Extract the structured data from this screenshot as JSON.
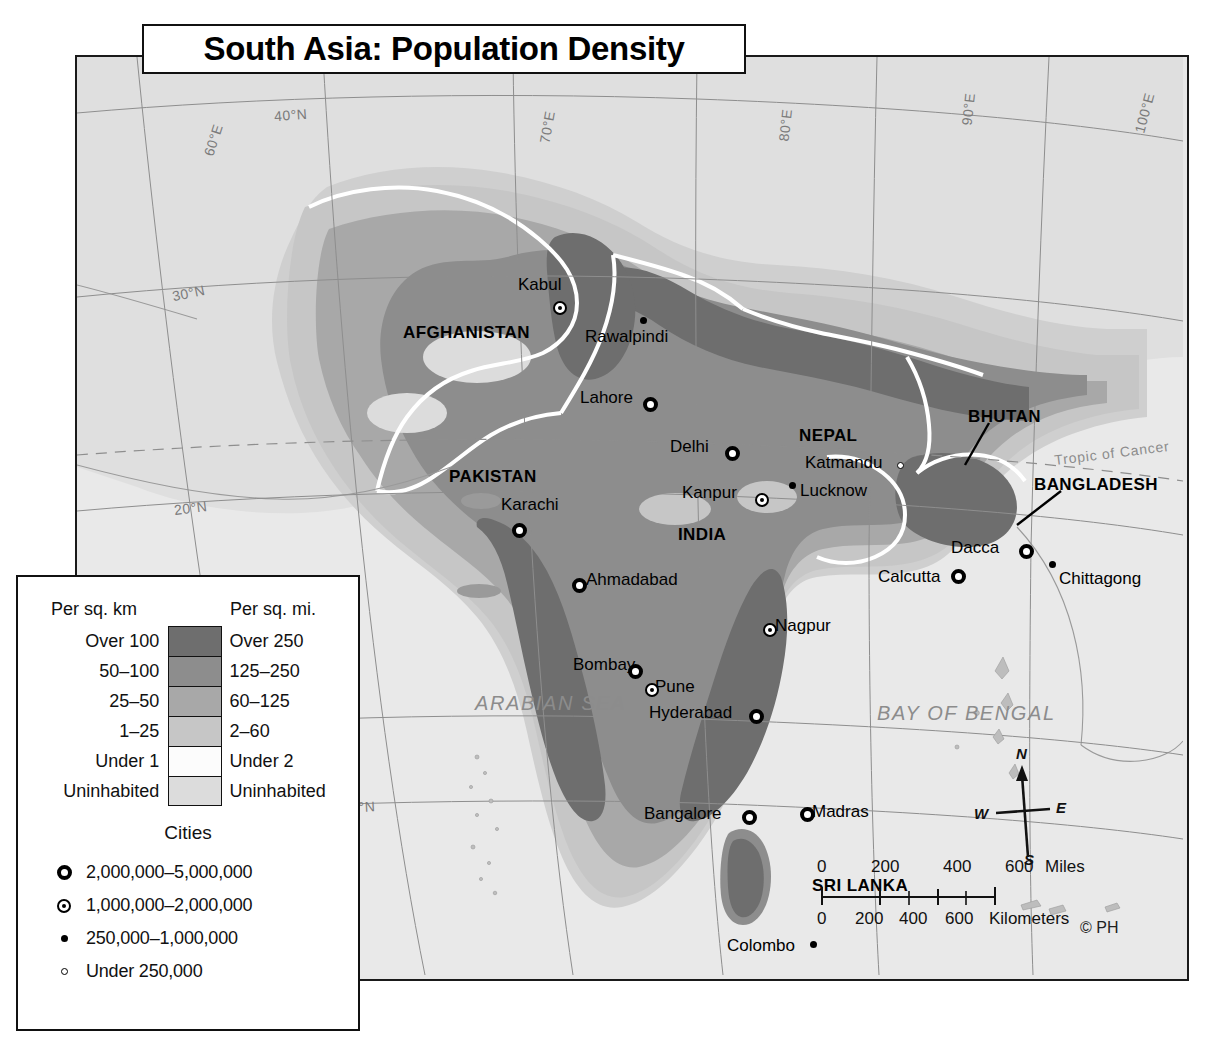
{
  "title": "South Asia: Population Density",
  "map": {
    "copyright": "© PH",
    "seas": [
      {
        "name": "ARABIAN SEA",
        "x": 398,
        "y": 635
      },
      {
        "name": "BAY OF BENGAL",
        "x": 800,
        "y": 645
      }
    ],
    "tropic_label": "Tropic of Cancer",
    "graticule": [
      {
        "label": "60°E",
        "x": 120,
        "y": 75,
        "rot": -72
      },
      {
        "label": "70°E",
        "x": 454,
        "y": 62,
        "rot": -80
      },
      {
        "label": "80°E",
        "x": 692,
        "y": 60,
        "rot": -84
      },
      {
        "label": "90°E",
        "x": 875,
        "y": 44,
        "rot": -84
      },
      {
        "label": "100°E",
        "x": 1047,
        "y": 48,
        "rot": -75
      },
      {
        "label": "40°N",
        "x": 197,
        "y": 50,
        "rot": -4
      },
      {
        "label": "30°N",
        "x": 95,
        "y": 228,
        "rot": -12
      },
      {
        "label": "20°N",
        "x": 97,
        "y": 443,
        "rot": -7
      },
      {
        "label": "10°N",
        "x": 265,
        "y": 742,
        "rot": -3
      }
    ],
    "countries": [
      {
        "name": "AFGHANISTAN",
        "x": 326,
        "y": 266
      },
      {
        "name": "PAKISTAN",
        "x": 372,
        "y": 410
      },
      {
        "name": "INDIA",
        "x": 601,
        "y": 468
      },
      {
        "name": "NEPAL",
        "x": 722,
        "y": 369
      },
      {
        "name": "BHUTAN",
        "x": 891,
        "y": 350
      },
      {
        "name": "BANGLADESH",
        "x": 957,
        "y": 418
      },
      {
        "name": "SRI LANKA",
        "x": 735,
        "y": 819
      }
    ],
    "cities": [
      {
        "name": "Kabul",
        "label_x": 441,
        "label_y": 218,
        "dot_x": 476,
        "dot_y": 244,
        "sym": "mid"
      },
      {
        "name": "Rawalpindi",
        "label_x": 508,
        "label_y": 270,
        "dot_x": 563,
        "dot_y": 260,
        "sym": "small"
      },
      {
        "name": "Lahore",
        "label_x": 503,
        "label_y": 331,
        "dot_x": 566,
        "dot_y": 340,
        "sym": "big"
      },
      {
        "name": "Karachi",
        "label_x": 424,
        "label_y": 438,
        "dot_x": 435,
        "dot_y": 466,
        "sym": "big"
      },
      {
        "name": "Delhi",
        "label_x": 593,
        "label_y": 380,
        "dot_x": 648,
        "dot_y": 389,
        "sym": "big"
      },
      {
        "name": "Katmandu",
        "label_x": 728,
        "label_y": 396,
        "dot_x": 820,
        "dot_y": 405,
        "sym": "tiny"
      },
      {
        "name": "Kanpur",
        "label_x": 605,
        "label_y": 426,
        "dot_x": 678,
        "dot_y": 436,
        "sym": "mid"
      },
      {
        "name": "Lucknow",
        "label_x": 723,
        "label_y": 424,
        "dot_x": 712,
        "dot_y": 425,
        "sym": "small"
      },
      {
        "name": "Ahmadabad",
        "label_x": 509,
        "label_y": 513,
        "dot_x": 495,
        "dot_y": 521,
        "sym": "big"
      },
      {
        "name": "Nagpur",
        "label_x": 698,
        "label_y": 559,
        "dot_x": 686,
        "dot_y": 566,
        "sym": "mid"
      },
      {
        "name": "Bombay",
        "label_x": 496,
        "label_y": 598,
        "dot_x": 551,
        "dot_y": 607,
        "sym": "big"
      },
      {
        "name": "Pune",
        "label_x": 578,
        "label_y": 620,
        "dot_x": 568,
        "dot_y": 626,
        "sym": "mid"
      },
      {
        "name": "Hyderabad",
        "label_x": 572,
        "label_y": 646,
        "dot_x": 672,
        "dot_y": 652,
        "sym": "big"
      },
      {
        "name": "Bangalore",
        "label_x": 567,
        "label_y": 747,
        "dot_x": 665,
        "dot_y": 753,
        "sym": "big"
      },
      {
        "name": "Madras",
        "label_x": 735,
        "label_y": 745,
        "dot_x": 723,
        "dot_y": 750,
        "sym": "big"
      },
      {
        "name": "Colombo",
        "label_x": 650,
        "label_y": 879,
        "dot_x": 733,
        "dot_y": 884,
        "sym": "small"
      },
      {
        "name": "Dacca",
        "label_x": 874,
        "label_y": 481,
        "dot_x": 942,
        "dot_y": 487,
        "sym": "big"
      },
      {
        "name": "Calcutta",
        "label_x": 801,
        "label_y": 510,
        "dot_x": 874,
        "dot_y": 512,
        "sym": "big"
      },
      {
        "name": "Chittagong",
        "label_x": 982,
        "label_y": 512,
        "dot_x": 972,
        "dot_y": 504,
        "sym": "small"
      }
    ],
    "scale": {
      "miles_ticks": [
        "0",
        "200",
        "400",
        "600"
      ],
      "miles_unit": "Miles",
      "km_ticks": [
        "0",
        "200",
        "400",
        "600"
      ],
      "km_unit": "Kilometers"
    },
    "compass": {
      "n": "N",
      "e": "E",
      "s": "S",
      "w": "W"
    }
  },
  "legend": {
    "header_left": "Per sq. km",
    "header_right": "Per sq. mi.",
    "classes": [
      {
        "km": "Over 100",
        "mi": "Over 250",
        "color": "#6e6e6e"
      },
      {
        "km": "50–100",
        "mi": "125–250",
        "color": "#8d8d8d"
      },
      {
        "km": "25–50",
        "mi": "60–125",
        "color": "#a8a8a8"
      },
      {
        "km": "1–25",
        "mi": "2–60",
        "color": "#c6c6c6"
      },
      {
        "km": "Under 1",
        "mi": "Under 2",
        "color": "#fcfcfc"
      },
      {
        "km": "Uninhabited",
        "mi": "Uninhabited",
        "color": "#dcdcdc"
      }
    ],
    "cities_title": "Cities",
    "city_classes": [
      {
        "sym": "big",
        "label": "2,000,000–5,000,000"
      },
      {
        "sym": "mid",
        "label": "1,000,000–2,000,000"
      },
      {
        "sym": "small",
        "label": "250,000–1,000,000"
      },
      {
        "sym": "tiny",
        "label": "Under 250,000"
      }
    ]
  }
}
